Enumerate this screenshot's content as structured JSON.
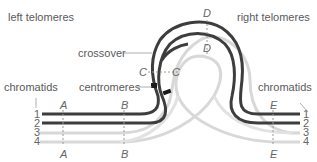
{
  "labels": {
    "left_telomeres": "left telomeres",
    "right_telomeres": "right telomeres",
    "crossover": "crossover",
    "centromeres": "centromeres",
    "chromatids_left": "chromatids",
    "chromatids_right": "chromatids"
  },
  "loci": {
    "A_top": "A",
    "B_top": "B",
    "C_left": "C",
    "C_right": "C",
    "D_top": "D",
    "D_inner": "D",
    "E_top": "E",
    "A_bottom": "A",
    "B_bottom": "B",
    "E_bottom": "E"
  },
  "chromatid_numbers": {
    "left": [
      "1",
      "2",
      "3",
      "4"
    ],
    "right": [
      "1",
      "2",
      "3",
      "4"
    ]
  },
  "colors": {
    "dark_chromatid": "#3d3d3d",
    "light_chromatid": "#d6d6d6",
    "label_text": "#5a5a5a",
    "marker": "#1a1a1a"
  }
}
